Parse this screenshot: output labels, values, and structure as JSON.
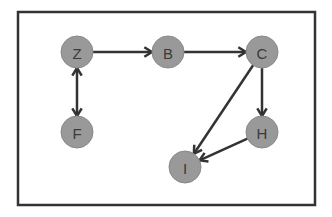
{
  "diagram": {
    "type": "directed-graph",
    "colors": {
      "node_fill": "#999999",
      "edge": "#333333",
      "frame": "#333333",
      "label": "#3a3a3a",
      "background": "#ffffff"
    },
    "nodes": [
      {
        "id": "Z",
        "label": "Z"
      },
      {
        "id": "B",
        "label": "B"
      },
      {
        "id": "C",
        "label": "C"
      },
      {
        "id": "F",
        "label": "F"
      },
      {
        "id": "H",
        "label": "H"
      },
      {
        "id": "I",
        "label": "I"
      }
    ],
    "edges": [
      {
        "from": "Z",
        "to": "B",
        "direction": "forward"
      },
      {
        "from": "B",
        "to": "C",
        "direction": "forward"
      },
      {
        "from": "Z",
        "to": "F",
        "direction": "both"
      },
      {
        "from": "C",
        "to": "H",
        "direction": "forward"
      },
      {
        "from": "C",
        "to": "I",
        "direction": "forward"
      },
      {
        "from": "H",
        "to": "I",
        "direction": "forward"
      }
    ]
  }
}
